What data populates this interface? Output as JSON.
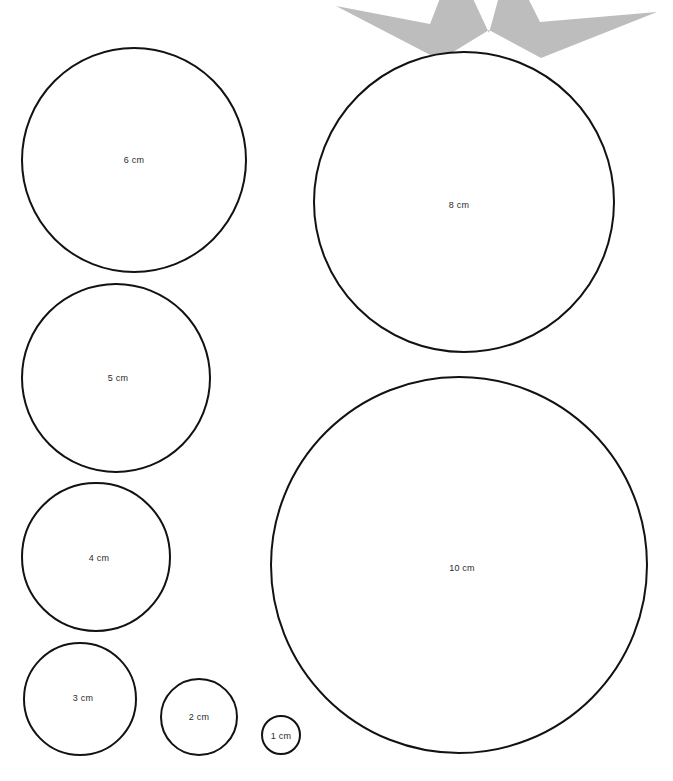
{
  "page": {
    "background_color": "#ffffff",
    "width": 673,
    "height": 781
  },
  "style": {
    "circle_stroke_color": "#121212",
    "circle_fill_color": "#ffffff",
    "circle_stroke_width": 2,
    "label_color": "#2b2b2b",
    "label_font_size": 9,
    "star_color": "#bdbdbd"
  },
  "decorations": [
    {
      "name": "star-shape",
      "kind": "star",
      "points": 5,
      "color": "#bdbdbd",
      "clipped": "top",
      "description": "Partial gray five-pointed star cropped at the top edge of the page"
    }
  ],
  "circles": [
    {
      "id": "circle-6cm",
      "label": "6 cm",
      "value": 6,
      "unit": "cm",
      "cx": 134,
      "cy": 160,
      "r": 112,
      "label_x": 134,
      "label_y": 160
    },
    {
      "id": "circle-8cm",
      "label": "8 cm",
      "value": 8,
      "unit": "cm",
      "cx": 464,
      "cy": 202,
      "r": 150,
      "label_x": 459,
      "label_y": 205
    },
    {
      "id": "circle-5cm",
      "label": "5 cm",
      "value": 5,
      "unit": "cm",
      "cx": 116,
      "cy": 378,
      "r": 94,
      "label_x": 118,
      "label_y": 378
    },
    {
      "id": "circle-4cm",
      "label": "4 cm",
      "value": 4,
      "unit": "cm",
      "cx": 96,
      "cy": 557,
      "r": 74,
      "label_x": 99,
      "label_y": 558
    },
    {
      "id": "circle-10cm",
      "label": "10 cm",
      "value": 10,
      "unit": "cm",
      "cx": 459,
      "cy": 565,
      "r": 188,
      "label_x": 462,
      "label_y": 568
    },
    {
      "id": "circle-3cm",
      "label": "3 cm",
      "value": 3,
      "unit": "cm",
      "cx": 80,
      "cy": 699,
      "r": 56,
      "label_x": 83,
      "label_y": 698
    },
    {
      "id": "circle-2cm",
      "label": "2 cm",
      "value": 2,
      "unit": "cm",
      "cx": 199,
      "cy": 717,
      "r": 38,
      "label_x": 199,
      "label_y": 717
    },
    {
      "id": "circle-1cm",
      "label": "1 cm",
      "value": 1,
      "unit": "cm",
      "cx": 281,
      "cy": 735,
      "r": 19,
      "label_x": 281,
      "label_y": 736
    }
  ]
}
